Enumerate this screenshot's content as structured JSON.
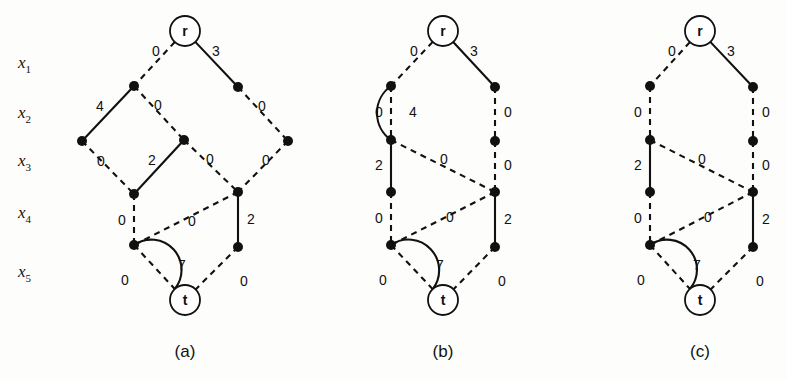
{
  "figure": {
    "background": "#fdfdfc",
    "ink": "#111111",
    "width": 787,
    "height": 381
  },
  "axis": {
    "name": "variable-levels",
    "labels": [
      {
        "text": "x",
        "sub": "1",
        "x": 18,
        "y": 68
      },
      {
        "text": "x",
        "sub": "2",
        "x": 18,
        "y": 118
      },
      {
        "text": "x",
        "sub": "3",
        "x": 18,
        "y": 166
      },
      {
        "text": "x",
        "sub": "4",
        "x": 18,
        "y": 218
      },
      {
        "text": "x",
        "sub": "5",
        "x": 18,
        "y": 277
      }
    ]
  },
  "panels": [
    {
      "id": "a",
      "caption": "(a)",
      "caption_x": 185,
      "caption_y": 357,
      "terminals": [
        {
          "id": "r",
          "label": "r",
          "cx": 185,
          "cy": 31,
          "r": 15
        },
        {
          "id": "t",
          "label": "t",
          "cx": 185,
          "cy": 300,
          "r": 15
        }
      ],
      "nodes": [
        {
          "id": "n1",
          "cx": 134,
          "cy": 86,
          "r": 5
        },
        {
          "id": "n2",
          "cx": 238,
          "cy": 87,
          "r": 5
        },
        {
          "id": "n3",
          "cx": 82,
          "cy": 141,
          "r": 5
        },
        {
          "id": "n4",
          "cx": 184,
          "cy": 140,
          "r": 5
        },
        {
          "id": "n5",
          "cx": 288,
          "cy": 141,
          "r": 5
        },
        {
          "id": "n6",
          "cx": 134,
          "cy": 194,
          "r": 5
        },
        {
          "id": "n7",
          "cx": 238,
          "cy": 192,
          "r": 5
        },
        {
          "id": "n8",
          "cx": 134,
          "cy": 245,
          "r": 5
        },
        {
          "id": "n9",
          "cx": 238,
          "cy": 247,
          "r": 5
        }
      ],
      "edges": [
        {
          "from": "r",
          "to": "n1",
          "style": "dashed",
          "weight": "0",
          "lx": 156,
          "ly": 52
        },
        {
          "from": "r",
          "to": "n2",
          "style": "solid",
          "weight": "3",
          "lx": 216,
          "ly": 52
        },
        {
          "from": "n1",
          "to": "n3",
          "style": "solid",
          "weight": "4",
          "lx": 100,
          "ly": 107
        },
        {
          "from": "n1",
          "to": "n4",
          "style": "dashed",
          "weight": "0",
          "lx": 158,
          "ly": 106
        },
        {
          "from": "n2",
          "to": "n5",
          "style": "dashed",
          "weight": "0",
          "lx": 262,
          "ly": 107
        },
        {
          "from": "n3",
          "to": "n6",
          "style": "dashed",
          "weight": "0",
          "lx": 101,
          "ly": 162
        },
        {
          "from": "n4",
          "to": "n6",
          "style": "solid",
          "weight": "2",
          "lx": 152,
          "ly": 161
        },
        {
          "from": "n4",
          "to": "n7",
          "style": "dashed",
          "weight": "0",
          "lx": 210,
          "ly": 160
        },
        {
          "from": "n5",
          "to": "n7",
          "style": "dashed",
          "weight": "0",
          "lx": 266,
          "ly": 161
        },
        {
          "from": "n6",
          "to": "n8",
          "style": "dashed",
          "weight": "0",
          "lx": 122,
          "ly": 221
        },
        {
          "from": "n7",
          "to": "n8",
          "style": "dashed",
          "weight": "0",
          "lx": 192,
          "ly": 222
        },
        {
          "from": "n7",
          "to": "n9",
          "style": "solid",
          "weight": "2",
          "lx": 251,
          "ly": 220
        },
        {
          "from": "n8",
          "to": "t",
          "style": "dashed",
          "weight": "0",
          "lx": 125,
          "ly": 281
        },
        {
          "from": "n9",
          "to": "t",
          "style": "dashed",
          "weight": "0",
          "lx": 244,
          "ly": 282
        }
      ],
      "curved_edges": [
        {
          "from": "n8",
          "to": "t",
          "style": "solid",
          "weight": "7",
          "sweep": 1,
          "bow": 26,
          "lx": 182,
          "ly": 266
        }
      ]
    },
    {
      "id": "b",
      "caption": "(b)",
      "caption_x": 443,
      "caption_y": 357,
      "terminals": [
        {
          "id": "r",
          "label": "r",
          "cx": 443,
          "cy": 31,
          "r": 15
        },
        {
          "id": "t",
          "label": "t",
          "cx": 443,
          "cy": 300,
          "r": 15
        }
      ],
      "nodes": [
        {
          "id": "n1",
          "cx": 391,
          "cy": 86,
          "r": 5
        },
        {
          "id": "n2",
          "cx": 495,
          "cy": 87,
          "r": 5
        },
        {
          "id": "n3",
          "cx": 391,
          "cy": 140,
          "r": 5
        },
        {
          "id": "n4",
          "cx": 495,
          "cy": 141,
          "r": 5
        },
        {
          "id": "n5",
          "cx": 391,
          "cy": 192,
          "r": 5
        },
        {
          "id": "n6",
          "cx": 495,
          "cy": 192,
          "r": 5
        },
        {
          "id": "n7",
          "cx": 391,
          "cy": 245,
          "r": 5
        },
        {
          "id": "n8",
          "cx": 495,
          "cy": 247,
          "r": 5
        }
      ],
      "edges": [
        {
          "from": "r",
          "to": "n1",
          "style": "dashed",
          "weight": "0",
          "lx": 414,
          "ly": 52
        },
        {
          "from": "r",
          "to": "n2",
          "style": "solid",
          "weight": "3",
          "lx": 474,
          "ly": 52
        },
        {
          "from": "n1",
          "to": "n3",
          "style": "dashed",
          "weight": "0",
          "lx": 379,
          "ly": 113
        },
        {
          "from": "n2",
          "to": "n4",
          "style": "dashed",
          "weight": "0",
          "lx": 508,
          "ly": 113
        },
        {
          "from": "n3",
          "to": "n5",
          "style": "solid",
          "weight": "2",
          "lx": 379,
          "ly": 166
        },
        {
          "from": "n3",
          "to": "n6",
          "style": "dashed",
          "weight": "0",
          "lx": 444,
          "ly": 160
        },
        {
          "from": "n4",
          "to": "n6",
          "style": "dashed",
          "weight": "0",
          "lx": 508,
          "ly": 166
        },
        {
          "from": "n5",
          "to": "n7",
          "style": "dashed",
          "weight": "0",
          "lx": 379,
          "ly": 219
        },
        {
          "from": "n6",
          "to": "n7",
          "style": "dashed",
          "weight": "0",
          "lx": 450,
          "ly": 218
        },
        {
          "from": "n6",
          "to": "n8",
          "style": "solid",
          "weight": "2",
          "lx": 508,
          "ly": 220
        },
        {
          "from": "n7",
          "to": "t",
          "style": "dashed",
          "weight": "0",
          "lx": 383,
          "ly": 281
        },
        {
          "from": "n8",
          "to": "t",
          "style": "dashed",
          "weight": "0",
          "lx": 502,
          "ly": 282
        }
      ],
      "curved_edges": [
        {
          "from": "n1",
          "to": "n3",
          "style": "solid",
          "weight": "4",
          "sweep": 0,
          "bow": 14,
          "lx": 413,
          "ly": 113
        },
        {
          "from": "n7",
          "to": "t",
          "style": "solid",
          "weight": "7",
          "sweep": 1,
          "bow": 26,
          "lx": 440,
          "ly": 266
        }
      ]
    },
    {
      "id": "c",
      "caption": "(c)",
      "caption_x": 700,
      "caption_y": 357,
      "terminals": [
        {
          "id": "r",
          "label": "r",
          "cx": 700,
          "cy": 31,
          "r": 15
        },
        {
          "id": "t",
          "label": "t",
          "cx": 700,
          "cy": 300,
          "r": 15
        }
      ],
      "nodes": [
        {
          "id": "n1",
          "cx": 650,
          "cy": 86,
          "r": 5
        },
        {
          "id": "n2",
          "cx": 753,
          "cy": 87,
          "r": 5
        },
        {
          "id": "n3",
          "cx": 650,
          "cy": 140,
          "r": 5
        },
        {
          "id": "n4",
          "cx": 753,
          "cy": 141,
          "r": 5
        },
        {
          "id": "n5",
          "cx": 650,
          "cy": 192,
          "r": 5
        },
        {
          "id": "n6",
          "cx": 753,
          "cy": 192,
          "r": 5
        },
        {
          "id": "n7",
          "cx": 650,
          "cy": 245,
          "r": 5
        },
        {
          "id": "n8",
          "cx": 753,
          "cy": 247,
          "r": 5
        }
      ],
      "edges": [
        {
          "from": "r",
          "to": "n1",
          "style": "dashed",
          "weight": "0",
          "lx": 672,
          "ly": 52
        },
        {
          "from": "r",
          "to": "n2",
          "style": "solid",
          "weight": "3",
          "lx": 731,
          "ly": 52
        },
        {
          "from": "n1",
          "to": "n3",
          "style": "dashed",
          "weight": "0",
          "lx": 638,
          "ly": 113
        },
        {
          "from": "n2",
          "to": "n4",
          "style": "dashed",
          "weight": "0",
          "lx": 766,
          "ly": 113
        },
        {
          "from": "n3",
          "to": "n5",
          "style": "solid",
          "weight": "2",
          "lx": 638,
          "ly": 166
        },
        {
          "from": "n3",
          "to": "n6",
          "style": "dashed",
          "weight": "0",
          "lx": 702,
          "ly": 160
        },
        {
          "from": "n4",
          "to": "n6",
          "style": "dashed",
          "weight": "0",
          "lx": 766,
          "ly": 166
        },
        {
          "from": "n5",
          "to": "n7",
          "style": "dashed",
          "weight": "0",
          "lx": 638,
          "ly": 219
        },
        {
          "from": "n6",
          "to": "n7",
          "style": "dashed",
          "weight": "0",
          "lx": 708,
          "ly": 218
        },
        {
          "from": "n6",
          "to": "n8",
          "style": "solid",
          "weight": "2",
          "lx": 766,
          "ly": 220
        },
        {
          "from": "n7",
          "to": "t",
          "style": "dashed",
          "weight": "0",
          "lx": 641,
          "ly": 281
        },
        {
          "from": "n8",
          "to": "t",
          "style": "dashed",
          "weight": "0",
          "lx": 760,
          "ly": 282
        }
      ],
      "curved_edges": [
        {
          "from": "n7",
          "to": "t",
          "style": "solid",
          "weight": "7",
          "sweep": 1,
          "bow": 26,
          "lx": 697,
          "ly": 266
        }
      ]
    }
  ]
}
